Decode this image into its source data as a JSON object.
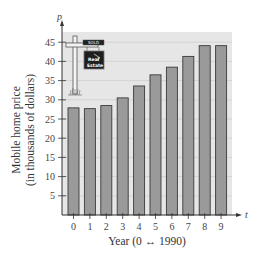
{
  "chart_data": {
    "type": "bar",
    "title": "",
    "xlabel": "Year (0 ↔ 1990)",
    "ylabel_line1": "Mobile home price",
    "ylabel_line2": "(in thousands of dollars)",
    "x_var": "t",
    "y_var": "p",
    "categories": [
      "0",
      "1",
      "2",
      "3",
      "4",
      "5",
      "6",
      "7",
      "8",
      "9"
    ],
    "values": [
      27.9,
      27.7,
      28.5,
      30.5,
      33.6,
      36.5,
      38.5,
      41.3,
      44.1,
      44.1
    ],
    "ylim": [
      0,
      48
    ],
    "yticks": [
      5,
      10,
      15,
      20,
      25,
      30,
      35,
      40,
      45
    ],
    "grid": true,
    "legend": null,
    "annotation": {
      "type": "sign-illustration",
      "sign_top_text": "SOLD",
      "sign_main_text_line1": "Real",
      "sign_main_text_line2": "Estate"
    },
    "colors": {
      "plot_background": "#e6e6e6",
      "bar_fill": "#9a9a9a",
      "bar_stroke": "#3a3a3a",
      "grid": "#c8c8c8",
      "axis": "#333333"
    }
  }
}
